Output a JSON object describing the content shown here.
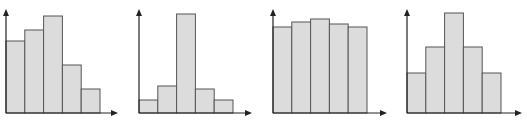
{
  "chart_data": [
    {
      "type": "bar",
      "title": "",
      "xlabel": "",
      "ylabel": "",
      "categories": [
        "1",
        "2",
        "3",
        "4",
        "5"
      ],
      "values": [
        72,
        83,
        97,
        48,
        24
      ],
      "shape": "left-skewed",
      "grid": false,
      "legend": null
    },
    {
      "type": "bar",
      "title": "",
      "xlabel": "",
      "ylabel": "",
      "categories": [
        "1",
        "2",
        "3",
        "4",
        "5"
      ],
      "values": [
        13,
        27,
        99,
        24,
        13
      ],
      "shape": "peaked",
      "grid": false,
      "legend": null
    },
    {
      "type": "bar",
      "title": "",
      "xlabel": "",
      "ylabel": "",
      "categories": [
        "1",
        "2",
        "3",
        "4",
        "5"
      ],
      "values": [
        86,
        91,
        94,
        89,
        86
      ],
      "shape": "uniform",
      "grid": false,
      "legend": null
    },
    {
      "type": "bar",
      "title": "",
      "xlabel": "",
      "ylabel": "",
      "categories": [
        "1",
        "2",
        "3",
        "4",
        "5"
      ],
      "values": [
        40,
        66,
        100,
        66,
        40
      ],
      "shape": "symmetric",
      "grid": false,
      "legend": null
    }
  ],
  "style": {
    "bar_fill": "#dcdcdc",
    "bar_stroke": "#555555",
    "axis_color": "#222222"
  }
}
